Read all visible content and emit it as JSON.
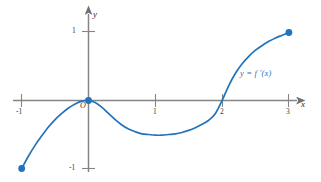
{
  "figure": {
    "title": "",
    "background_color": "#ffffff",
    "curve_color": "#2272bc",
    "axis_color": "#808080",
    "text_color": "#2b2b2b"
  },
  "axes": {
    "x_axis_label": "x",
    "y_axis_label": "y",
    "origin_label": "O",
    "x_ticks": [
      {
        "value": -1,
        "label": "-1"
      },
      {
        "value": 1,
        "label": "1"
      },
      {
        "value": 2,
        "label": "2"
      },
      {
        "value": 3,
        "label": "3"
      }
    ],
    "y_ticks": [
      {
        "value": 1,
        "label": "1"
      },
      {
        "value": -1,
        "label": "-1"
      }
    ]
  },
  "chart_data": {
    "type": "line",
    "title": "",
    "xlabel": "x",
    "ylabel": "y",
    "xlim": [
      -1.3,
      3.45
    ],
    "ylim": [
      -1.45,
      1.45
    ],
    "grid": false,
    "legend": "none",
    "annotations": [
      {
        "text": "y = f '(x)",
        "x": 2.45,
        "y": 0.45
      },
      {
        "text": "O",
        "x": -0.12,
        "y": -0.16
      }
    ],
    "series": [
      {
        "name": "y = f '(x)",
        "color": "#2272bc",
        "x": [
          -1.0,
          -0.9,
          -0.8,
          -0.7,
          -0.6,
          -0.5,
          -0.4,
          -0.3,
          -0.2,
          -0.1,
          0.0,
          0.1,
          0.2,
          0.3,
          0.4,
          0.5,
          0.6,
          0.7,
          0.8,
          0.9,
          1.0,
          1.1,
          1.2,
          1.3,
          1.4,
          1.5,
          1.6,
          1.7,
          1.8,
          1.9,
          2.0,
          2.1,
          2.2,
          2.3,
          2.4,
          2.5,
          2.6,
          2.7,
          2.8,
          2.9,
          3.0
        ],
        "y": [
          -1.0,
          -0.82,
          -0.66,
          -0.52,
          -0.39,
          -0.28,
          -0.19,
          -0.11,
          -0.05,
          -0.01,
          0.0,
          -0.03,
          -0.1,
          -0.19,
          -0.28,
          -0.36,
          -0.42,
          -0.46,
          -0.49,
          -0.5,
          -0.51,
          -0.51,
          -0.5,
          -0.49,
          -0.47,
          -0.44,
          -0.4,
          -0.35,
          -0.29,
          -0.19,
          0.0,
          0.22,
          0.4,
          0.54,
          0.65,
          0.74,
          0.81,
          0.87,
          0.92,
          0.96,
          1.0
        ]
      }
    ],
    "endpoints": [
      {
        "x": -1,
        "y": -1,
        "marker": "filled-circle",
        "color": "#2272bc"
      },
      {
        "x": 0,
        "y": 0,
        "marker": "filled-circle",
        "color": "#2272bc"
      },
      {
        "x": 3,
        "y": 1,
        "marker": "filled-circle",
        "color": "#2272bc"
      }
    ]
  }
}
